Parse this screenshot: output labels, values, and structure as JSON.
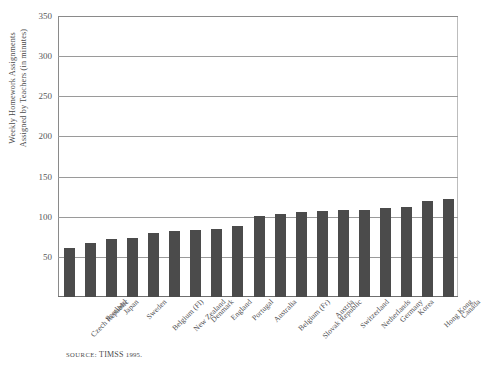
{
  "figure": {
    "title": "",
    "source_prefix": "SOURCE:",
    "source_name": "TIMSS",
    "source_year": "1995."
  },
  "axes": {
    "y_title_line1": "Weekly Homework Assignments",
    "y_title_line2": "Assigned by Teachers (in minutes)",
    "y_ticks": [
      "350",
      "300",
      "250",
      "200",
      "150",
      "100",
      "50"
    ],
    "x_title": ""
  },
  "chart_data": {
    "type": "bar",
    "title": "",
    "subtitle": "",
    "xlabel": "",
    "ylabel": "Weekly Homework Assignments Assigned by Teachers (in minutes)",
    "ylim": [
      0,
      350
    ],
    "yticks": [
      0,
      50,
      100,
      150,
      200,
      250,
      300,
      350
    ],
    "grid": true,
    "legend": "none",
    "bar_color": "#4b4b4b",
    "source": "SOURCE: TIMSS 1995.",
    "categories": [
      "Czech Republic",
      "Scotland",
      "Japan",
      "Sweden",
      "Belgium (Fl)",
      "New Zealand",
      "Denmark",
      "England",
      "Portugal",
      "Australia",
      "Belgium (Fr)",
      "Slovak Republic",
      "Austria",
      "Switzerland",
      "Netherlands",
      "Germany",
      "Korea",
      "Hong Kong",
      "Canada"
    ],
    "values": [
      61,
      67,
      72,
      74,
      80,
      82,
      83,
      85,
      88,
      101,
      103,
      106,
      107,
      108,
      109,
      111,
      112,
      119,
      122
    ]
  }
}
